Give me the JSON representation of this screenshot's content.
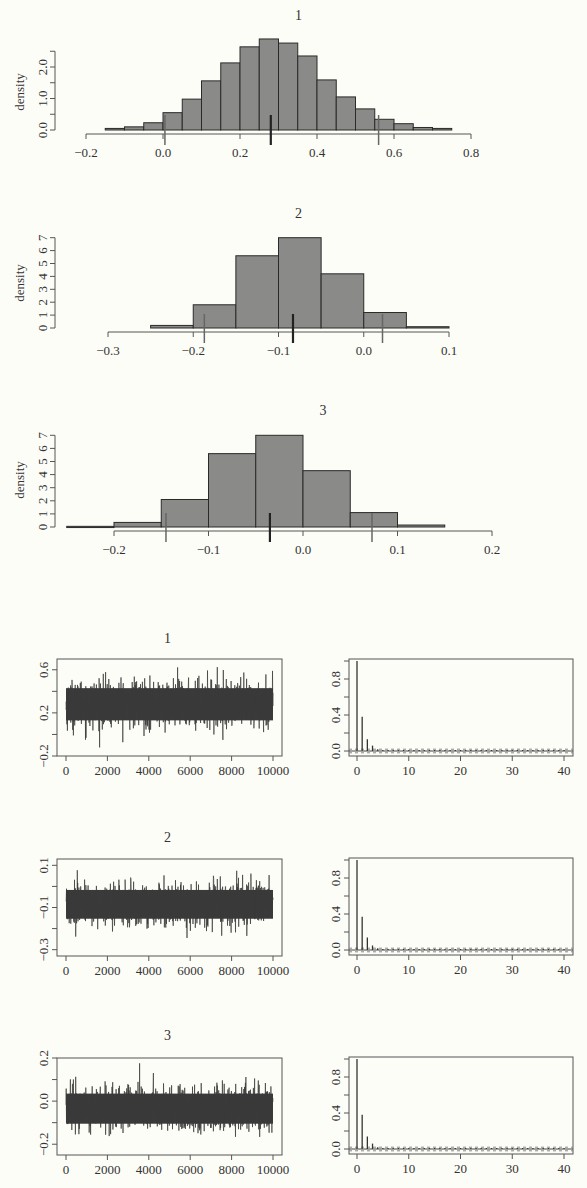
{
  "chart_data": [
    {
      "type": "bar",
      "kind": "histogram",
      "title": "1",
      "xlabel": "",
      "ylabel": "density",
      "bin_edges": [
        -0.15,
        -0.1,
        -0.05,
        0.0,
        0.05,
        0.1,
        0.15,
        0.2,
        0.25,
        0.3,
        0.35,
        0.4,
        0.45,
        0.5,
        0.55,
        0.6,
        0.65,
        0.7,
        0.75
      ],
      "values": [
        0.05,
        0.1,
        0.23,
        0.55,
        0.98,
        1.56,
        2.13,
        2.64,
        2.89,
        2.76,
        2.35,
        1.59,
        1.05,
        0.67,
        0.34,
        0.2,
        0.08,
        0.05
      ],
      "xlim": [
        -0.2,
        0.8
      ],
      "xticks": [
        -0.2,
        0.0,
        0.2,
        0.4,
        0.6,
        0.8
      ],
      "xtick_labels": [
        "−0.2",
        "0.0",
        "0.2",
        "0.4",
        "0.6",
        "0.8"
      ],
      "yticks": [
        0.0,
        0.5,
        1.0,
        1.5,
        2.0,
        2.5
      ],
      "ytick_labels": [
        "0.0",
        "",
        "1.0",
        "",
        "2.0",
        ""
      ],
      "markers": {
        "lower_2_5": 0.005,
        "median": 0.28,
        "upper_97_5": 0.56
      },
      "grid": false
    },
    {
      "type": "bar",
      "kind": "histogram",
      "title": "2",
      "xlabel": "",
      "ylabel": "density",
      "bin_edges": [
        -0.25,
        -0.2,
        -0.15,
        -0.1,
        -0.05,
        0.0,
        0.05,
        0.1
      ],
      "values": [
        0.2,
        1.8,
        5.6,
        7.0,
        4.2,
        1.2,
        0.1
      ],
      "xlim": [
        -0.3,
        0.1
      ],
      "xticks": [
        -0.3,
        -0.2,
        -0.1,
        0.0,
        0.1
      ],
      "xtick_labels": [
        "−0.3",
        "−0.2",
        "−0.1",
        "0.0",
        "0.1"
      ],
      "yticks": [
        0,
        1,
        2,
        3,
        4,
        5,
        6,
        7
      ],
      "ytick_labels": [
        "0",
        "1",
        "2",
        "3",
        "4",
        "5",
        "6",
        "7"
      ],
      "markers": {
        "lower_2_5": -0.187,
        "median": -0.083,
        "upper_97_5": 0.022
      },
      "grid": false
    },
    {
      "type": "bar",
      "kind": "histogram",
      "title": "3",
      "xlabel": "",
      "ylabel": "density",
      "bin_edges": [
        -0.25,
        -0.2,
        -0.15,
        -0.1,
        -0.05,
        0.0,
        0.05,
        0.1,
        0.15
      ],
      "values": [
        0.05,
        0.35,
        2.1,
        5.6,
        7.0,
        4.3,
        1.1,
        0.15
      ],
      "xlim": [
        -0.2,
        0.2
      ],
      "xticks": [
        -0.2,
        -0.1,
        0.0,
        0.1,
        0.2
      ],
      "xtick_labels": [
        "−0.2",
        "−0.1",
        "0.0",
        "0.1",
        "0.2"
      ],
      "yticks": [
        0,
        1,
        2,
        3,
        4,
        5,
        6,
        7
      ],
      "ytick_labels": [
        "0",
        "1",
        "2",
        "3",
        "4",
        "5",
        "6",
        "7"
      ],
      "markers": {
        "lower_2_5": -0.145,
        "median": -0.035,
        "upper_97_5": 0.073
      },
      "grid": false
    },
    {
      "type": "line",
      "kind": "trace",
      "title": "1",
      "x_range": [
        0,
        10000
      ],
      "xticks": [
        0,
        2000,
        4000,
        6000,
        8000,
        10000
      ],
      "xtick_labels": [
        "0",
        "2000",
        "4000",
        "6000",
        "8000",
        "10000"
      ],
      "ylim": [
        -0.2,
        0.7
      ],
      "yticks": [
        -0.2,
        0.0,
        0.2,
        0.4,
        0.6
      ],
      "ytick_labels": [
        "−0.2",
        "",
        "0.2",
        "",
        "0.6"
      ],
      "series_summary": {
        "center": 0.28,
        "band_low": 0.06,
        "band_high": 0.52,
        "min": -0.12,
        "max": 0.7
      }
    },
    {
      "type": "bar",
      "kind": "acf",
      "title": "",
      "lags": [
        0,
        1,
        2,
        3,
        4,
        5,
        6,
        7,
        8,
        9,
        10
      ],
      "values": [
        1.0,
        0.38,
        0.13,
        0.06,
        0.02,
        0.01,
        0.0,
        0.0,
        0.0,
        0.0,
        0.0
      ],
      "xlim": [
        -1,
        41
      ],
      "xticks": [
        0,
        10,
        20,
        30,
        40
      ],
      "xtick_labels": [
        "0",
        "10",
        "20",
        "30",
        "40"
      ],
      "yticks": [
        0.0,
        0.2,
        0.4,
        0.6,
        0.8,
        1.0
      ],
      "ytick_labels": [
        "0.0",
        "",
        "0.4",
        "",
        "0.8",
        ""
      ],
      "conf_band": 0.02
    },
    {
      "type": "line",
      "kind": "trace",
      "title": "2",
      "x_range": [
        0,
        10000
      ],
      "xticks": [
        0,
        2000,
        4000,
        6000,
        8000,
        10000
      ],
      "xtick_labels": [
        "0",
        "2000",
        "4000",
        "6000",
        "8000",
        "10000"
      ],
      "ylim": [
        -0.33,
        0.13
      ],
      "yticks": [
        -0.3,
        -0.2,
        -0.1,
        0.0,
        0.1
      ],
      "ytick_labels": [
        "−0.3",
        "",
        "−0.1",
        "",
        "0.1"
      ],
      "series_summary": {
        "center": -0.085,
        "band_low": -0.19,
        "band_high": 0.02,
        "min": -0.31,
        "max": 0.12
      }
    },
    {
      "type": "bar",
      "kind": "acf",
      "title": "",
      "lags": [
        0,
        1,
        2,
        3,
        4,
        5,
        6,
        7,
        8,
        9,
        10
      ],
      "values": [
        1.0,
        0.37,
        0.14,
        0.05,
        0.02,
        0.01,
        0.0,
        0.0,
        0.0,
        0.0,
        0.0
      ],
      "xlim": [
        -1,
        41
      ],
      "xticks": [
        0,
        10,
        20,
        30,
        40
      ],
      "xtick_labels": [
        "0",
        "10",
        "20",
        "30",
        "40"
      ],
      "yticks": [
        0.0,
        0.2,
        0.4,
        0.6,
        0.8,
        1.0
      ],
      "ytick_labels": [
        "0.0",
        "",
        "0.4",
        "",
        "0.8",
        ""
      ],
      "conf_band": 0.02
    },
    {
      "type": "line",
      "kind": "trace",
      "title": "3",
      "x_range": [
        0,
        10000
      ],
      "xticks": [
        0,
        2000,
        4000,
        6000,
        8000,
        10000
      ],
      "xtick_labels": [
        "0",
        "2000",
        "4000",
        "6000",
        "8000",
        "10000"
      ],
      "ylim": [
        -0.25,
        0.2
      ],
      "yticks": [
        -0.2,
        -0.1,
        0.0,
        0.1,
        0.2
      ],
      "ytick_labels": [
        "−0.2",
        "",
        "0.0",
        "",
        "0.2"
      ],
      "series_summary": {
        "center": -0.035,
        "band_low": -0.14,
        "band_high": 0.075,
        "min": -0.24,
        "max": 0.2
      }
    },
    {
      "type": "bar",
      "kind": "acf",
      "title": "",
      "lags": [
        0,
        1,
        2,
        3,
        4,
        5,
        6,
        7,
        8,
        9,
        10
      ],
      "values": [
        1.0,
        0.38,
        0.14,
        0.06,
        0.02,
        0.01,
        0.0,
        0.0,
        0.0,
        0.0,
        0.0
      ],
      "xlim": [
        -1,
        41
      ],
      "xticks": [
        0,
        10,
        20,
        30,
        40
      ],
      "xtick_labels": [
        "0",
        "10",
        "20",
        "30",
        "40"
      ],
      "yticks": [
        0.0,
        0.2,
        0.4,
        0.6,
        0.8,
        1.0
      ],
      "ytick_labels": [
        "0.0",
        "",
        "0.4",
        "",
        "0.8",
        ""
      ],
      "conf_band": 0.02
    }
  ],
  "colors": {
    "background": "#fdfdf8",
    "bar_fill": "#8a8a88",
    "bar_stroke": "#2a2a2a",
    "axis": "#555555",
    "trace": "#3a3a3a",
    "text": "#333333"
  }
}
